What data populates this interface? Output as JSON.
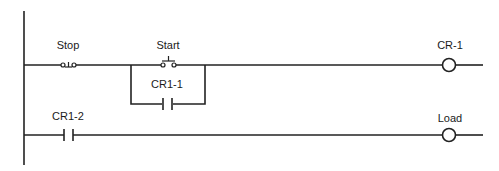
{
  "diagram": {
    "type": "ladder-logic",
    "rungs": [
      {
        "id": 1,
        "elements": [
          {
            "kind": "pushbutton-normally-closed",
            "label": "Stop"
          },
          {
            "kind": "pushbutton-normally-open",
            "label": "Start"
          },
          {
            "kind": "contact-normally-open",
            "label": "CR1-1",
            "parallel_with": "Start"
          },
          {
            "kind": "coil",
            "label": "CR-1"
          }
        ]
      },
      {
        "id": 2,
        "elements": [
          {
            "kind": "contact-normally-open",
            "label": "CR1-2"
          },
          {
            "kind": "coil",
            "label": "Load"
          }
        ]
      }
    ]
  },
  "labels": {
    "stop": "Stop",
    "start": "Start",
    "cr1_1": "CR1-1",
    "cr_1": "CR-1",
    "cr1_2": "CR1-2",
    "load": "Load"
  },
  "colors": {
    "line": "#222222",
    "background": "#ffffff"
  }
}
